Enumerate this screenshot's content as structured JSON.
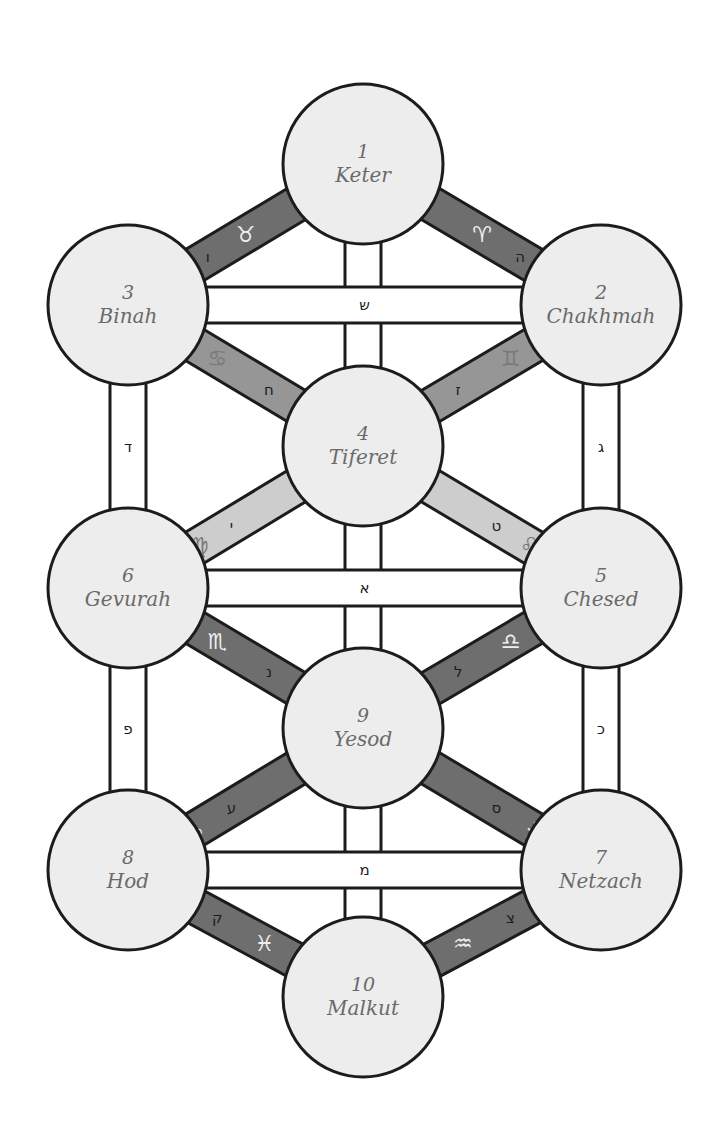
{
  "diagram": {
    "colors": {
      "background": "#ffffff",
      "circle_fill": "#ededed",
      "outline": "#1c1c1c",
      "path_white": "#ffffff",
      "path_dark": "#6e6e6e",
      "path_medium": "#969696",
      "path_light": "#cdcdcd",
      "label_text": "#6a6a6a",
      "zodiac_on_dark": "#eeeeee",
      "zodiac_on_light": "#7a7a7a"
    },
    "sefirot": [
      {
        "id": "keter",
        "number": "1",
        "name": "Keter",
        "cx": 363,
        "cy": 164
      },
      {
        "id": "chakhmah",
        "number": "2",
        "name": "Chakhmah",
        "cx": 601,
        "cy": 305
      },
      {
        "id": "binah",
        "number": "3",
        "name": "Binah",
        "cx": 128,
        "cy": 305
      },
      {
        "id": "tiferet",
        "number": "4",
        "name": "Tiferet",
        "cx": 363,
        "cy": 446
      },
      {
        "id": "chesed",
        "number": "5",
        "name": "Chesed",
        "cx": 601,
        "cy": 588
      },
      {
        "id": "gevurah",
        "number": "6",
        "name": "Gevurah",
        "cx": 128,
        "cy": 588
      },
      {
        "id": "netzach",
        "number": "7",
        "name": "Netzach",
        "cx": 601,
        "cy": 870
      },
      {
        "id": "hod",
        "number": "8",
        "name": "Hod",
        "cx": 128,
        "cy": 870
      },
      {
        "id": "yesod",
        "number": "9",
        "name": "Yesod",
        "cx": 363,
        "cy": 728
      },
      {
        "id": "malkut",
        "number": "10",
        "name": "Malkut",
        "cx": 363,
        "cy": 997
      }
    ],
    "paths": [
      {
        "from": "keter",
        "to": "chakhmah",
        "letter": "ה",
        "zodiac": "♈",
        "shade": "dark"
      },
      {
        "from": "keter",
        "to": "binah",
        "letter": "ו",
        "zodiac": "♉",
        "shade": "dark"
      },
      {
        "from": "keter",
        "to": "tiferet",
        "letter": "ב",
        "zodiac": "",
        "shade": "white"
      },
      {
        "from": "chakhmah",
        "to": "binah",
        "letter": "ש",
        "zodiac": "",
        "shade": "white"
      },
      {
        "from": "chakhmah",
        "to": "tiferet",
        "letter": "ז",
        "zodiac": "♊",
        "shade": "medium"
      },
      {
        "from": "binah",
        "to": "tiferet",
        "letter": "ח",
        "zodiac": "♋",
        "shade": "medium"
      },
      {
        "from": "chakhmah",
        "to": "chesed",
        "letter": "ג",
        "zodiac": "",
        "shade": "white"
      },
      {
        "from": "binah",
        "to": "gevurah",
        "letter": "ד",
        "zodiac": "",
        "shade": "white"
      },
      {
        "from": "tiferet",
        "to": "chesed",
        "letter": "ט",
        "zodiac": "♌",
        "shade": "light"
      },
      {
        "from": "tiferet",
        "to": "gevurah",
        "letter": "י",
        "zodiac": "♍",
        "shade": "light"
      },
      {
        "from": "tiferet",
        "to": "yesod",
        "letter": "ר",
        "zodiac": "",
        "shade": "white"
      },
      {
        "from": "chesed",
        "to": "gevurah",
        "letter": "א",
        "zodiac": "",
        "shade": "white"
      },
      {
        "from": "chesed",
        "to": "yesod",
        "letter": "ל",
        "zodiac": "♎",
        "shade": "dark"
      },
      {
        "from": "gevurah",
        "to": "yesod",
        "letter": "נ",
        "zodiac": "♏",
        "shade": "dark"
      },
      {
        "from": "chesed",
        "to": "netzach",
        "letter": "כ",
        "zodiac": "",
        "shade": "white"
      },
      {
        "from": "gevurah",
        "to": "hod",
        "letter": "פ",
        "zodiac": "",
        "shade": "white"
      },
      {
        "from": "yesod",
        "to": "netzach",
        "letter": "ס",
        "zodiac": "♐",
        "shade": "dark"
      },
      {
        "from": "yesod",
        "to": "hod",
        "letter": "ע",
        "zodiac": "♑",
        "shade": "dark"
      },
      {
        "from": "yesod",
        "to": "malkut",
        "letter": "ת",
        "zodiac": "",
        "shade": "white"
      },
      {
        "from": "netzach",
        "to": "hod",
        "letter": "מ",
        "zodiac": "",
        "shade": "white"
      },
      {
        "from": "netzach",
        "to": "malkut",
        "letter": "צ",
        "zodiac": "♒",
        "shade": "dark"
      },
      {
        "from": "hod",
        "to": "malkut",
        "letter": "ק",
        "zodiac": "♓",
        "shade": "dark"
      }
    ]
  }
}
